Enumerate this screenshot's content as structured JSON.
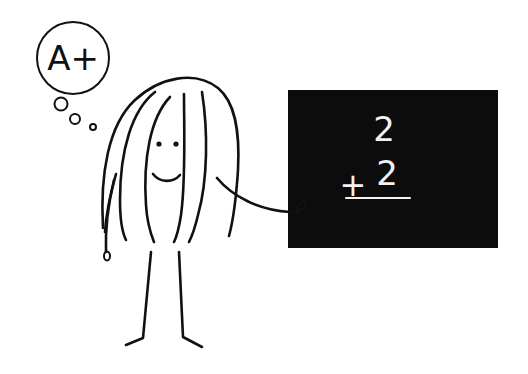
{
  "illustration": {
    "thought_bubble": {
      "text": "A+"
    },
    "blackboard": {
      "top_number": "2",
      "operator": "+",
      "bottom_number": "2",
      "background_color": "#0c0c0c",
      "chalk_color": "#f2f2f2"
    },
    "colors": {
      "ink": "#111111",
      "background": "#ffffff"
    }
  }
}
